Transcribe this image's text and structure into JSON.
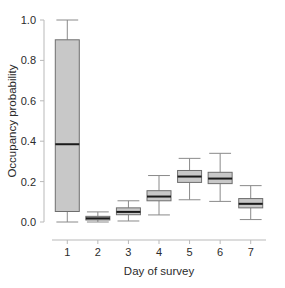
{
  "chart_data": {
    "type": "box",
    "title": "",
    "xlabel": "Day of survey",
    "ylabel": "Occupancy probability",
    "categories": [
      "1",
      "2",
      "3",
      "4",
      "5",
      "6",
      "7"
    ],
    "xtick_labels": [
      "1",
      "2",
      "3",
      "4",
      "5",
      "6",
      "7"
    ],
    "ytick_labels": [
      "0.0",
      "0.2",
      "0.4",
      "0.6",
      "0.8",
      "1.0"
    ],
    "ytick_values": [
      0.0,
      0.2,
      0.4,
      0.6,
      0.8,
      1.0
    ],
    "ylim": [
      -0.04,
      1.03
    ],
    "xlim": [
      0.5,
      7.5
    ],
    "grid": false,
    "legend": null,
    "box_fill_color": "#c8c8c8",
    "box_edge_color": "#6e6e6e",
    "median_color": "#1a1a1a",
    "whisker_color": "#8a8a8a",
    "axis_color": "#b9b9b9",
    "boxes": [
      {
        "category": "1",
        "whisker_low": 0.0,
        "q1": 0.052,
        "median": 0.385,
        "q3": 0.902,
        "whisker_high": 1.0
      },
      {
        "category": "2",
        "whisker_low": 0.0,
        "q1": 0.01,
        "median": 0.018,
        "q3": 0.028,
        "whisker_high": 0.05
      },
      {
        "category": "3",
        "whisker_low": 0.005,
        "q1": 0.036,
        "median": 0.05,
        "q3": 0.07,
        "whisker_high": 0.105
      },
      {
        "category": "4",
        "whisker_low": 0.035,
        "q1": 0.105,
        "median": 0.126,
        "q3": 0.155,
        "whisker_high": 0.23
      },
      {
        "category": "5",
        "whisker_low": 0.11,
        "q1": 0.196,
        "median": 0.225,
        "q3": 0.255,
        "whisker_high": 0.315
      },
      {
        "category": "6",
        "whisker_low": 0.102,
        "q1": 0.19,
        "median": 0.215,
        "q3": 0.246,
        "whisker_high": 0.34
      },
      {
        "category": "7",
        "whisker_low": 0.012,
        "q1": 0.07,
        "median": 0.09,
        "q3": 0.116,
        "whisker_high": 0.18
      }
    ]
  }
}
